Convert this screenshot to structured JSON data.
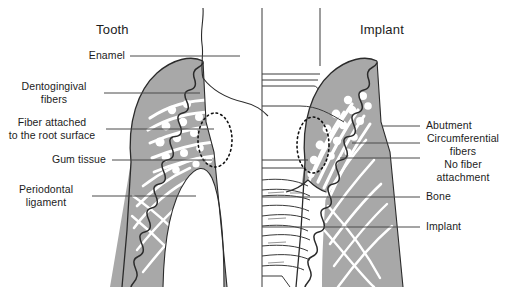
{
  "figure": {
    "width": 508,
    "height": 287,
    "background": "#ffffff",
    "tissue_gray": "#a8a8a8",
    "outline_color": "#2b2b2b",
    "fiber_white": "#ffffff",
    "leader_color": "#4a4a4a",
    "text_color": "#1c1c1c"
  },
  "panels": {
    "left": {
      "title": "Tooth"
    },
    "right": {
      "title": "Implant"
    }
  },
  "labels_left": [
    {
      "text": "Enamel",
      "name": "label-enamel"
    },
    {
      "text": "Dentogingival\nfibers",
      "name": "label-dentogingival-fibers"
    },
    {
      "text": "Fiber attached\nto the root surface",
      "name": "label-fiber-attached-root-surface"
    },
    {
      "text": "Gum tissue",
      "name": "label-gum-tissue"
    },
    {
      "text": "Periodontal\nligament",
      "name": "label-periodontal-ligament"
    }
  ],
  "labels_right": [
    {
      "text": "Abutment",
      "name": "label-abutment"
    },
    {
      "text": "Circumferential\nfibers",
      "name": "label-circumferential-fibers"
    },
    {
      "text": "No fiber\nattachment",
      "name": "label-no-fiber-attachment"
    },
    {
      "text": "Bone",
      "name": "label-bone"
    },
    {
      "text": "Implant",
      "name": "label-implant"
    }
  ],
  "annotations": {
    "dashed_ellipse_left": "attachment zone highlighted on natural tooth root",
    "dashed_ellipse_right": "attachment zone highlighted at implant abutment"
  }
}
